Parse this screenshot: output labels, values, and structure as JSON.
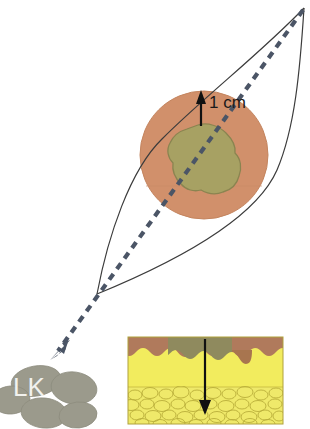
{
  "figure": {
    "background_color": "#ffffff",
    "width": 310,
    "height": 429
  },
  "annotations": {
    "margin_label": "1 cm",
    "lymph_node_label": "LK"
  },
  "colors": {
    "skin": "#d1906b",
    "skin_edge": "#c3835f",
    "lesion": "#a7a163",
    "lesion_outline": "#8a8450",
    "excision_outline": "#3c3c3c",
    "dashed_arrow": "#4b5566",
    "lymph_node_fill": "#9b9a8c",
    "lymph_node_edge": "#8b8a7c",
    "label_text": "#f2f2ee",
    "epidermis_brown": "#b07a5c",
    "epidermis_tumor": "#8f8a5e",
    "dermis": "#f2ec5e",
    "fat_cells": "#efe96a",
    "fat_outline": "#b9ae3a",
    "inset_border": "#b0a23c",
    "depth_arrow": "#111111",
    "scale_arrow": "#111111"
  },
  "elements": {
    "skin_circle": {
      "name": "skin-surface-circle",
      "cx": 204,
      "cy": 155,
      "r": 64
    },
    "lesion": {
      "name": "melanoma-lesion",
      "cx": 203,
      "cy": 160
    },
    "excision_ellipse": {
      "name": "fusiform-excision-outline",
      "apex_top": [
        304,
        8
      ],
      "apex_bottom": [
        97,
        294
      ]
    },
    "scale_arrow": {
      "name": "margin-scale-arrow",
      "x": 201,
      "y_top": 92,
      "y_bottom": 126
    },
    "dashed_arrow": {
      "name": "lymphatic-drainage-arrow",
      "start": [
        303,
        10
      ],
      "end": [
        52,
        357
      ]
    },
    "lymph_nodes": {
      "name": "sentinel-lymph-node-cluster",
      "count": 5,
      "nodes": [
        {
          "cx": 36,
          "cy": 381,
          "rx": 24,
          "ry": 15,
          "rot": -10
        },
        {
          "cx": 72,
          "cy": 387,
          "rx": 22,
          "ry": 15,
          "rot": 8
        },
        {
          "cx": 12,
          "cy": 399,
          "rx": 18,
          "ry": 13,
          "rot": -4
        },
        {
          "cx": 42,
          "cy": 412,
          "rx": 22,
          "ry": 14,
          "rot": 6
        },
        {
          "cx": 76,
          "cy": 414,
          "rx": 18,
          "ry": 12,
          "rot": -6
        }
      ]
    },
    "inset": {
      "name": "skin-cross-section-inset",
      "x": 128,
      "y": 337,
      "width": 155,
      "height": 87,
      "layers": [
        "epidermis",
        "dermis",
        "subcutaneous-fat"
      ],
      "depth_arrow": {
        "x": 205,
        "y_top": 340,
        "y_bottom": 414
      }
    }
  }
}
